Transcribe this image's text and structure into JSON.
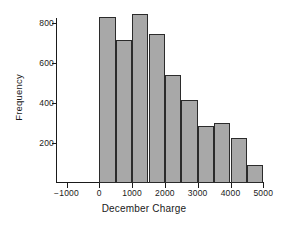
{
  "chart_data": {
    "type": "bar",
    "title": "",
    "xlabel": "December Charge",
    "ylabel": "Frequency",
    "xlim": [
      -1250,
      5100
    ],
    "ylim": [
      0,
      880
    ],
    "grid": false,
    "legend": null,
    "bin_width": 500,
    "bin_edges": [
      0,
      500,
      1000,
      1500,
      2000,
      2500,
      3000,
      3500,
      4000,
      4500,
      5000
    ],
    "categories": [
      "0-500",
      "500-1000",
      "1000-1500",
      "1500-2000",
      "2000-2500",
      "2500-3000",
      "3000-3500",
      "3500-4000",
      "4000-4500",
      "4500-5000"
    ],
    "values": [
      830,
      715,
      845,
      745,
      540,
      415,
      285,
      300,
      225,
      90
    ],
    "xticks": [
      {
        "value": -1000,
        "label": "−1000"
      },
      {
        "value": 0,
        "label": "0"
      },
      {
        "value": 1000,
        "label": "1000"
      },
      {
        "value": 2000,
        "label": "2000"
      },
      {
        "value": 3000,
        "label": "3000"
      },
      {
        "value": 4000,
        "label": "4000"
      },
      {
        "value": 5000,
        "label": "5000"
      }
    ],
    "yticks": [
      {
        "value": 200,
        "label": "200"
      },
      {
        "value": 400,
        "label": "400"
      },
      {
        "value": 600,
        "label": "600"
      },
      {
        "value": 800,
        "label": "800"
      }
    ],
    "colors": {
      "bar_fill": "#a8a8a8",
      "bar_edge": "#2b2b2b",
      "axis": "#1a1a1a",
      "background": "#ffffff",
      "text": "#1a1a1a"
    }
  }
}
